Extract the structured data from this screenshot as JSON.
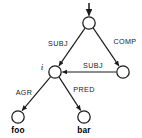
{
  "diagram": {
    "type": "directed-graph",
    "background_color": "#ffffff",
    "stroke_color": "#1a1a1a",
    "nodes": [
      {
        "id": "root",
        "label": "",
        "cx": 89,
        "cy": 23,
        "r": 6.2,
        "label_style": "none"
      },
      {
        "id": "middle",
        "label": "i",
        "cx": 55,
        "cy": 72,
        "r": 6.2,
        "label_style": "italic"
      },
      {
        "id": "right",
        "label": "",
        "cx": 123,
        "cy": 72,
        "r": 6.2,
        "label_style": "none"
      },
      {
        "id": "foo",
        "label": "foo",
        "cx": 18,
        "cy": 117,
        "r": 6.2,
        "label_style": "bold"
      },
      {
        "id": "bar",
        "label": "bar",
        "cx": 84,
        "cy": 117,
        "r": 6.2,
        "label_style": "bold"
      }
    ],
    "entry_arrow": {
      "label": "",
      "x": 89,
      "y_start": 3,
      "y_end": 16
    },
    "edges": [
      {
        "id": "root-subj-middle",
        "label": "SUBJ",
        "from": "root",
        "to": "middle",
        "label_x": 58,
        "label_y": 46
      },
      {
        "id": "root-comp-right",
        "label": "COMP",
        "from": "root",
        "to": "right",
        "label_x": 125,
        "label_y": 44
      },
      {
        "id": "right-subj-middle",
        "label": "SUBJ",
        "from": "right",
        "to": "middle",
        "label_x": 93,
        "label_y": 68
      },
      {
        "id": "middle-agr-foo",
        "label": "AGR",
        "from": "middle",
        "to": "foo",
        "label_x": 24,
        "label_y": 95
      },
      {
        "id": "middle-pred-bar",
        "label": "PRED",
        "from": "middle",
        "to": "bar",
        "label_x": 84,
        "label_y": 92
      }
    ]
  }
}
